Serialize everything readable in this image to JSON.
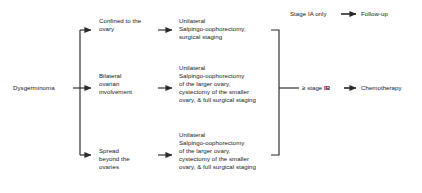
{
  "diagram": {
    "background_color": "#ffffff",
    "line_color": "#2b2b2b",
    "text_color": "#161616"
  },
  "root": {
    "label": "Dysgerminoma"
  },
  "branches": [
    {
      "id": "confined",
      "condition": "Confined to the\novary",
      "treatment": "Unilateral\nSalpingo-oophorectomy,\nsurgical staging"
    },
    {
      "id": "bilateral",
      "condition": "Bilateral\novarian\ninvolvement",
      "treatment": "Unilateral\nSalpingo-oophorectomy\nof the larger ovary,\ncystectomy of the smaller\novary, & full surgical staging"
    },
    {
      "id": "spread",
      "condition": "Spread\nbeyond the\novaries",
      "treatment": "Unilateral\nSalpingo-oophorectomy\nof the larger ovary,\ncystectomy of the smaller\novary, & full surgical staging"
    }
  ],
  "outcomes": [
    {
      "id": "stage-ia",
      "stage_label": "Stage IA only",
      "stage_prefix": "Stage ",
      "stage_roman": "IA",
      "stage_suffix": " only",
      "result": "Follow-up"
    },
    {
      "id": "stage-ib",
      "stage_label": "≥ stage IB",
      "stage_prefix": "≥ stage ",
      "stage_roman": "IB",
      "stage_suffix": "",
      "result": "Chemotherapy"
    }
  ]
}
